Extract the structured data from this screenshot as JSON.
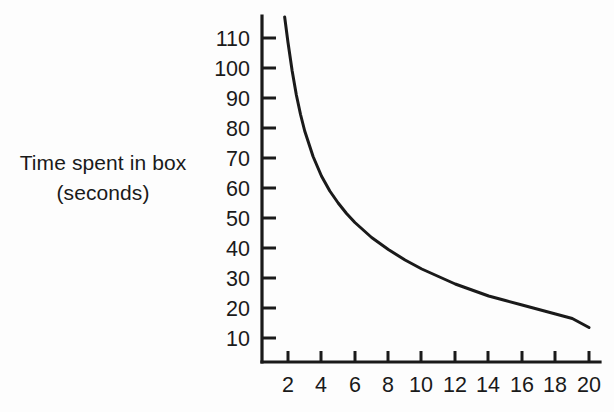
{
  "figure": {
    "background_color": "#fdfdfd",
    "ink_color": "#1a1a1a",
    "y_axis_label_line1": "Time spent in box",
    "y_axis_label_line2": "(seconds)"
  },
  "chart_data": {
    "type": "line",
    "title": "",
    "xlabel": "",
    "ylabel": "Time spent in box (seconds)",
    "xlim": [
      0,
      20.6
    ],
    "ylim": [
      0,
      118
    ],
    "grid": false,
    "legend": "none",
    "x_ticks": [
      2,
      4,
      6,
      8,
      10,
      12,
      14,
      16,
      18,
      20
    ],
    "x_tick_labels": [
      "2",
      "4",
      "6",
      "8",
      "10",
      "12",
      "14",
      "16",
      "18",
      "20"
    ],
    "y_ticks": [
      10,
      20,
      30,
      40,
      50,
      60,
      70,
      80,
      90,
      100,
      110
    ],
    "y_tick_labels": [
      "10",
      "20",
      "30",
      "40",
      "50",
      "60",
      "70",
      "80",
      "90",
      "100",
      "110"
    ],
    "series": [
      {
        "name": "Time spent in box",
        "x": [
          1.8,
          2.0,
          2.25,
          2.5,
          2.75,
          3.0,
          3.5,
          4.0,
          4.5,
          5.0,
          5.5,
          6.0,
          6.5,
          7.0,
          7.5,
          8.0,
          9.0,
          10.0,
          11.0,
          12.0,
          13.0,
          14.0,
          15.0,
          16.0,
          17.0,
          18.0,
          19.0,
          20.0
        ],
        "values": [
          117.0,
          108.5,
          99.0,
          91.0,
          84.5,
          79.0,
          70.5,
          64.0,
          59.0,
          55.0,
          51.5,
          48.5,
          46.0,
          43.5,
          41.5,
          39.5,
          36.0,
          33.0,
          30.5,
          28.0,
          26.0,
          24.0,
          22.5,
          21.0,
          19.5,
          18.0,
          16.5,
          13.5
        ]
      }
    ]
  },
  "ticks": {
    "y": [
      {
        "value": 110,
        "label": "110",
        "py": 38
      },
      {
        "value": 100,
        "label": "100",
        "py": 68
      },
      {
        "value": 90,
        "label": "90",
        "py": 98
      },
      {
        "value": 80,
        "label": "80",
        "py": 128
      },
      {
        "value": 70,
        "label": "70",
        "py": 158
      },
      {
        "value": 60,
        "label": "60",
        "py": 188
      },
      {
        "value": 50,
        "label": "50",
        "py": 218
      },
      {
        "value": 40,
        "label": "40",
        "py": 248
      },
      {
        "value": 30,
        "label": "30",
        "py": 278
      },
      {
        "value": 20,
        "label": "20",
        "py": 308
      },
      {
        "value": 10,
        "label": "10",
        "py": 338
      }
    ],
    "x": [
      {
        "value": 2,
        "label": "2",
        "px": 288
      },
      {
        "value": 4,
        "label": "4",
        "px": 321
      },
      {
        "value": 6,
        "label": "6",
        "px": 355
      },
      {
        "value": 8,
        "label": "8",
        "px": 388
      },
      {
        "value": 10,
        "label": "10",
        "px": 421
      },
      {
        "value": 12,
        "label": "12",
        "px": 455
      },
      {
        "value": 14,
        "label": "14",
        "px": 488
      },
      {
        "value": 16,
        "label": "16",
        "px": 522
      },
      {
        "value": 18,
        "label": "18",
        "px": 555
      },
      {
        "value": 20,
        "label": "20",
        "px": 589
      }
    ]
  }
}
